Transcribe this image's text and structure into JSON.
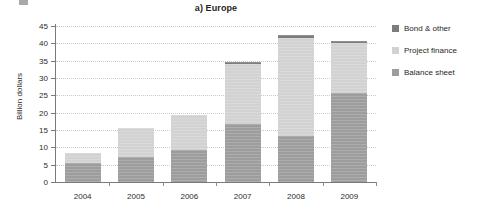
{
  "chart_data": {
    "type": "bar",
    "stacked": true,
    "title": "a) Europe",
    "xlabel": "",
    "ylabel": "Billion dollars",
    "categories": [
      "2004",
      "2005",
      "2006",
      "2007",
      "2008",
      "2009"
    ],
    "ylim": [
      0,
      45
    ],
    "yticks": [
      0,
      5,
      10,
      15,
      20,
      25,
      30,
      35,
      40,
      45
    ],
    "ytick_labels": [
      "0",
      "5",
      "10",
      "15",
      "20",
      "25",
      "30",
      "35",
      "40",
      "45"
    ],
    "grid": true,
    "grid_axis": "y",
    "legend_position": "right",
    "series": [
      {
        "name": "Balance sheet",
        "color": "#9d9d9d",
        "values": [
          5.4,
          7.2,
          9.3,
          16.8,
          13.3,
          25.8
        ]
      },
      {
        "name": "Project finance",
        "color": "#d2d2d2",
        "values": [
          3.1,
          8.5,
          10.0,
          17.2,
          28.3,
          14.2
        ]
      },
      {
        "name": "Bond & other",
        "color": "#7c7c7c",
        "values": [
          0.0,
          0.0,
          0.0,
          0.7,
          0.7,
          0.7
        ]
      }
    ],
    "totals": [
      8.5,
      15.7,
      19.3,
      34.7,
      42.3,
      40.7
    ]
  },
  "legend": {
    "items": [
      {
        "label": "Bond & other",
        "color": "#7c7c7c"
      },
      {
        "label": "Project finance",
        "color": "#d2d2d2"
      },
      {
        "label": "Balance sheet",
        "color": "#9d9d9d"
      }
    ]
  }
}
